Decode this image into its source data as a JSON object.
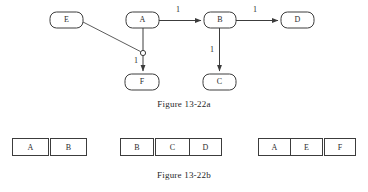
{
  "figure_a": {
    "caption": "Figure 13-22a",
    "nodes": [
      {
        "id": "E",
        "label": "E",
        "x": 50,
        "y": 12,
        "w": 33,
        "h": 16
      },
      {
        "id": "A",
        "label": "A",
        "x": 126,
        "y": 12,
        "w": 33,
        "h": 16
      },
      {
        "id": "B",
        "label": "B",
        "x": 204,
        "y": 12,
        "w": 32,
        "h": 16
      },
      {
        "id": "D",
        "label": "D",
        "x": 281,
        "y": 12,
        "w": 33,
        "h": 16
      },
      {
        "id": "F",
        "label": "F",
        "x": 125,
        "y": 74,
        "w": 34,
        "h": 16
      },
      {
        "id": "C",
        "label": "C",
        "x": 203,
        "y": 74,
        "w": 33,
        "h": 16
      }
    ],
    "edges": [
      {
        "from": "A",
        "to": "B",
        "label": "1",
        "kind": "horizontal-arrow"
      },
      {
        "from": "B",
        "to": "D",
        "label": "1",
        "kind": "horizontal-arrow"
      },
      {
        "from": "B",
        "to": "C",
        "label": "1",
        "kind": "vertical-arrow"
      },
      {
        "from": "A",
        "to": "F",
        "label": "1",
        "kind": "vertical-arrow-via-junction"
      },
      {
        "from": "E",
        "to": "junction",
        "label": "",
        "kind": "diagonal-line"
      }
    ],
    "junction": {
      "cx": 143,
      "cy": 53,
      "r": 2.6
    },
    "edge_labels": {
      "a_to_b": "1",
      "b_to_d": "1",
      "b_to_c": "1",
      "a_to_f": "1"
    }
  },
  "figure_b": {
    "caption": "Figure 13-22b",
    "tables": [
      {
        "name": "table-ab",
        "x": 12,
        "width": 74,
        "cells": [
          {
            "label": "A",
            "w": 37,
            "divider_before": "none"
          },
          {
            "label": "B",
            "w": 37,
            "divider_before": "double"
          }
        ]
      },
      {
        "name": "table-bcd",
        "x": 120,
        "width": 104,
        "cells": [
          {
            "label": "B",
            "w": 34,
            "divider_before": "none"
          },
          {
            "label": "C",
            "w": 35,
            "divider_before": "double"
          },
          {
            "label": "D",
            "w": 33,
            "divider_before": "single"
          }
        ]
      },
      {
        "name": "table-aef",
        "x": 258,
        "width": 98,
        "cells": [
          {
            "label": "A",
            "w": 33,
            "divider_before": "none"
          },
          {
            "label": "E",
            "w": 33,
            "divider_before": "single"
          },
          {
            "label": "F",
            "w": 32,
            "divider_before": "double"
          }
        ]
      }
    ]
  },
  "colors": {
    "background": "#ffffff",
    "stroke": "#3c3c3c",
    "text": "#2b2b2b"
  }
}
